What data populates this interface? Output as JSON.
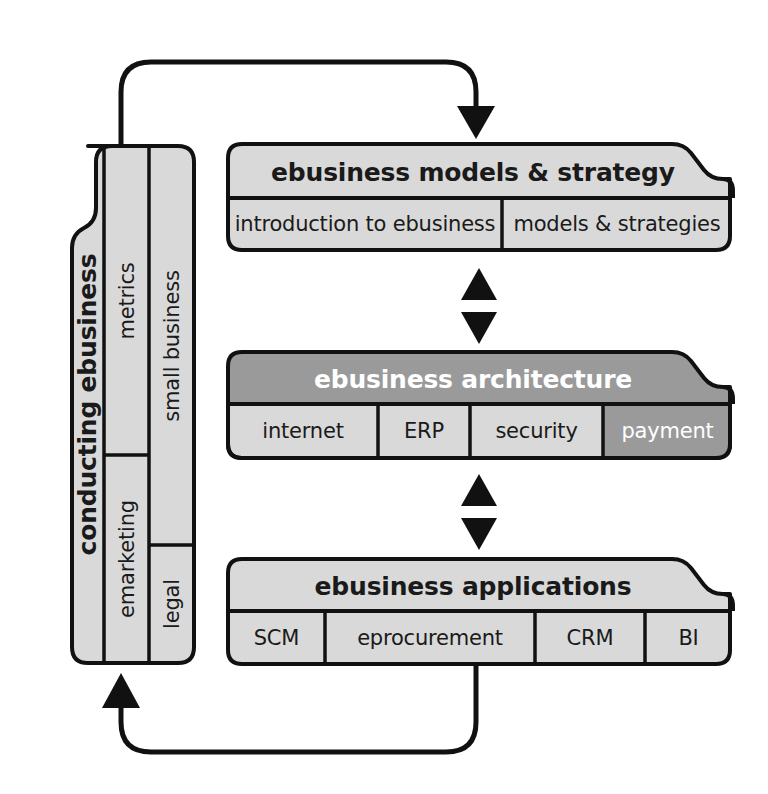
{
  "diagram": {
    "colors": {
      "fill_light": "#d9d9d9",
      "fill_dark": "#9a9a9a",
      "stroke": "#111111",
      "text_dark": "#1a1a1a",
      "text_light": "#ffffff",
      "background": "#ffffff"
    },
    "spine": {
      "label": "conducting ebusiness",
      "columns": [
        {
          "name": "middle-column",
          "cells": [
            {
              "label": "metrics"
            },
            {
              "label": "emarketing"
            }
          ]
        },
        {
          "name": "right-column",
          "cells": [
            {
              "label": "small business"
            },
            {
              "label": "legal"
            }
          ]
        }
      ]
    },
    "stacks": [
      {
        "name": "ebusiness-models-strategy",
        "header": "ebusiness models & strategy",
        "header_highlighted": false,
        "cells": [
          {
            "label": "introduction to ebusiness",
            "highlighted": false
          },
          {
            "label": "models & strategies",
            "highlighted": false
          }
        ]
      },
      {
        "name": "ebusiness-architecture",
        "header": "ebusiness architecture",
        "header_highlighted": true,
        "cells": [
          {
            "label": "internet",
            "highlighted": false
          },
          {
            "label": "ERP",
            "highlighted": false
          },
          {
            "label": "security",
            "highlighted": false
          },
          {
            "label": "payment",
            "highlighted": true
          }
        ]
      },
      {
        "name": "ebusiness-applications",
        "header": "ebusiness applications",
        "header_highlighted": false,
        "cells": [
          {
            "label": "SCM",
            "highlighted": false
          },
          {
            "label": "eprocurement",
            "highlighted": false
          },
          {
            "label": "CRM",
            "highlighted": false
          },
          {
            "label": "BI",
            "highlighted": false
          }
        ]
      }
    ],
    "connectors": [
      {
        "name": "feedback-arrow-top",
        "direction": "down",
        "description": "loops from spine up and over into ebusiness models & strategy"
      },
      {
        "name": "bidirectional-arrows-upper",
        "direction": "both",
        "description": "between models & strategy and architecture"
      },
      {
        "name": "bidirectional-arrows-lower",
        "direction": "both",
        "description": "between architecture and applications"
      },
      {
        "name": "feedback-arrow-bottom",
        "direction": "up",
        "description": "loops from applications down and back into spine"
      }
    ]
  }
}
